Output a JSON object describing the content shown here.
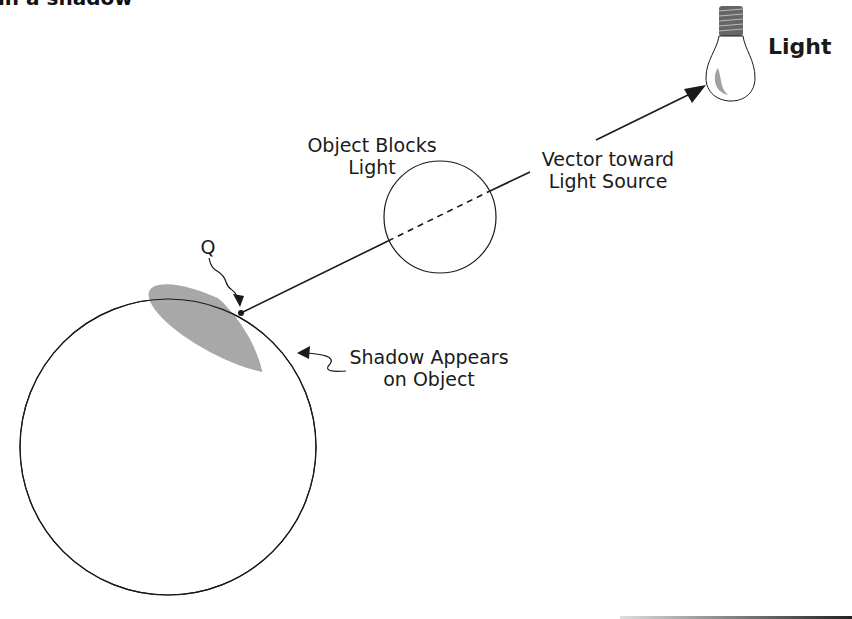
{
  "caption_fragment": "in a shadow",
  "labels": {
    "light": "Light",
    "object_blocks": "Object Blocks\nLight",
    "vector": "Vector toward\nLight Source",
    "q": "Q",
    "shadow": "Shadow Appears\non Object"
  },
  "colors": {
    "stroke": "#1a1a1a",
    "shadow_fill": "#a8a8a8",
    "bulb_highlight": "#a0a0a0"
  }
}
